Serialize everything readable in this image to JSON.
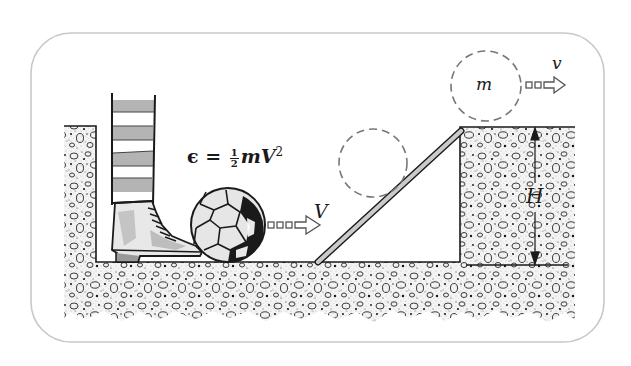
{
  "diagram": {
    "labels": {
      "energy_formula": {
        "lhs": "ϵ",
        "equals": "=",
        "fraction_numerator": "1",
        "fraction_denominator": "2",
        "mass": "m",
        "velocity": "V",
        "exponent": "2"
      },
      "initial_velocity": "V",
      "final_velocity": "v",
      "mass": "m",
      "height": "H"
    },
    "elements": [
      "striped-sock-leg",
      "laced-boot",
      "soccer-ball",
      "velocity-arrow-V",
      "ramp",
      "ghost-ball-on-ramp",
      "ghost-ball-on-ledge",
      "velocity-arrow-v",
      "height-dimension-H",
      "gravel-ground"
    ],
    "colors": {
      "frame_border": "#c8c8c8",
      "ink": "#1a1a1a",
      "sock_stripe": "#b4b4b4",
      "ramp_fill": "#c9c9c9",
      "ground_speckle": "#2a2a2a",
      "background": "#ffffff"
    }
  }
}
